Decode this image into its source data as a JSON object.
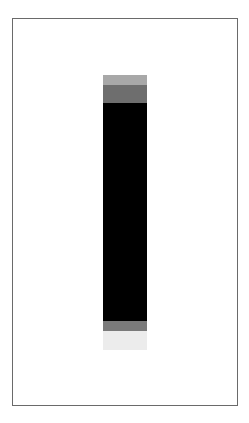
{
  "image": {
    "description": "Framed vertical bar with graded bands",
    "frame": {
      "border_color": "#6a6a6a",
      "background": "#ffffff"
    },
    "bar": {
      "segments": [
        {
          "name": "top-light-band",
          "top": 75,
          "height": 10,
          "color": "#a8a8a8"
        },
        {
          "name": "top-mid-band",
          "top": 85,
          "height": 18,
          "color": "#6e6e6e"
        },
        {
          "name": "core-black-band",
          "top": 103,
          "height": 218,
          "color": "#000000"
        },
        {
          "name": "bottom-mid-band",
          "top": 321,
          "height": 10,
          "color": "#7a7a7a"
        },
        {
          "name": "bottom-light-band",
          "top": 331,
          "height": 19,
          "color": "#ececec"
        }
      ]
    }
  }
}
